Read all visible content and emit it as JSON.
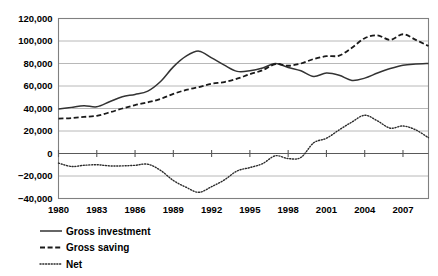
{
  "chart_data": {
    "type": "line",
    "title": "",
    "xlabel": "",
    "ylabel": "",
    "xlim": [
      1980,
      2009
    ],
    "ylim": [
      -40000,
      120000
    ],
    "grid": true,
    "legend_position": "bottom-left",
    "y_ticks": [
      120000,
      100000,
      80000,
      60000,
      40000,
      20000,
      0,
      -20000,
      -40000
    ],
    "y_tick_labels": [
      "120,000",
      "100,000",
      "80,000",
      "60,000",
      "40,000",
      "20,000",
      "0",
      "−20,000",
      "−40,000"
    ],
    "x_ticks": [
      1980,
      1983,
      1986,
      1989,
      1992,
      1995,
      1998,
      2001,
      2004,
      2007
    ],
    "x_tick_labels": [
      "1980",
      "1983",
      "1986",
      "1989",
      "1992",
      "1995",
      "1998",
      "2001",
      "2004",
      "2007"
    ],
    "x": [
      1980,
      1981,
      1982,
      1983,
      1984,
      1985,
      1986,
      1987,
      1988,
      1989,
      1990,
      1991,
      1992,
      1993,
      1994,
      1995,
      1996,
      1997,
      1998,
      1999,
      2000,
      2001,
      2002,
      2003,
      2004,
      2005,
      2006,
      2007,
      2008,
      2009
    ],
    "series": [
      {
        "name": "Gross investment",
        "style": "solid",
        "color": "#333333",
        "values": [
          39500,
          41000,
          42500,
          41500,
          46000,
          50500,
          52500,
          55500,
          64000,
          77000,
          86500,
          91000,
          85000,
          78500,
          73000,
          73500,
          76000,
          80000,
          76500,
          73500,
          68500,
          71500,
          69500,
          65000,
          67000,
          71500,
          75500,
          78500,
          79500,
          80000
        ]
      },
      {
        "name": "Gross saving",
        "style": "dashed",
        "color": "#1a1a1a",
        "values": [
          31000,
          31500,
          32500,
          33500,
          36500,
          40000,
          43000,
          45500,
          48500,
          53000,
          56500,
          59000,
          62000,
          63500,
          66500,
          70500,
          74000,
          79500,
          78000,
          80000,
          84000,
          86500,
          87000,
          94000,
          102500,
          105000,
          101000,
          106000,
          101000,
          95500
        ]
      },
      {
        "name": "Net",
        "style": "dotted",
        "color": "#2b2b2b",
        "values": [
          -8500,
          -11500,
          -10500,
          -10000,
          -11000,
          -11000,
          -10500,
          -9500,
          -15000,
          -24000,
          -30000,
          -34500,
          -29500,
          -23500,
          -15500,
          -12500,
          -9000,
          -2000,
          -4500,
          -3500,
          9500,
          13500,
          21000,
          28000,
          34000,
          29000,
          22500,
          24500,
          21000,
          14000
        ]
      }
    ]
  },
  "legend": {
    "items": [
      {
        "label": "Gross investment",
        "style": "solid"
      },
      {
        "label": "Gross saving",
        "style": "dashed"
      },
      {
        "label": "Net",
        "style": "dotted"
      }
    ]
  },
  "colors": {
    "gridline": "#a6a6a6",
    "border": "#808080",
    "axis": "#595959",
    "background": "#ffffff",
    "text": "#000000"
  }
}
